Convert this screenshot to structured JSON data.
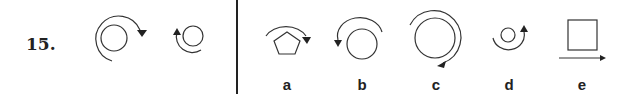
{
  "question": {
    "number": "15.",
    "stimulus": [
      {
        "shape": "circle",
        "arc": "outer-clockwise",
        "arrow": "right-down"
      },
      {
        "shape": "small-circle",
        "arc": "left-counterclockwise",
        "arrow": "up"
      }
    ],
    "options": [
      {
        "label": "a",
        "shape": "pentagon",
        "arc": "top-clockwise",
        "arrow": "down"
      },
      {
        "label": "b",
        "shape": "circle",
        "arc": "top-counterclockwise",
        "arrow": "down"
      },
      {
        "label": "c",
        "shape": "large-circle",
        "arc": "outer-clockwise",
        "arrow": "down-left"
      },
      {
        "label": "d",
        "shape": "small-circle",
        "arc": "bottom-counterclockwise",
        "arrow": "up"
      },
      {
        "label": "e",
        "shape": "square",
        "arc": "none",
        "arrow": "right"
      }
    ]
  },
  "colors": {
    "ink": "#222222",
    "background": "#ffffff"
  }
}
